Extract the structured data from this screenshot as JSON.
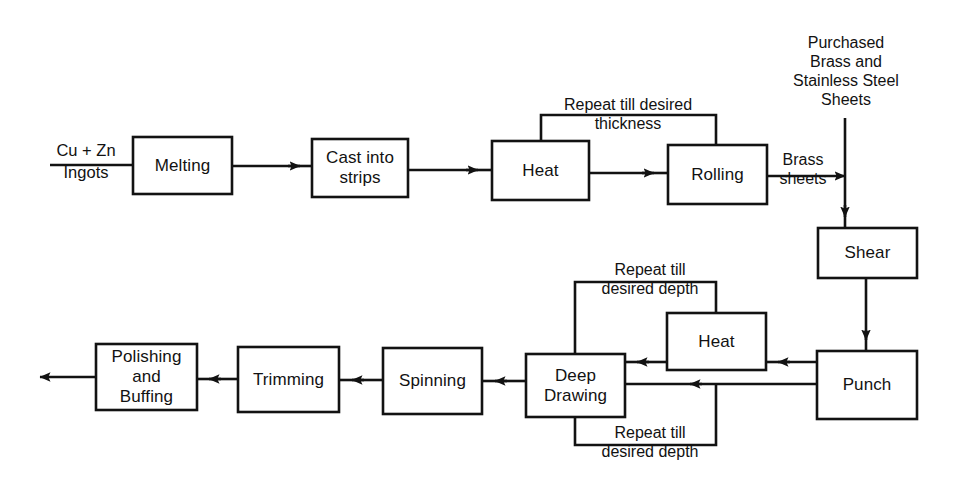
{
  "diagram": {
    "stroke_color": "#121212",
    "background_color": "#ffffff",
    "nodes": [
      {
        "id": "melting",
        "label": "Melting"
      },
      {
        "id": "cast",
        "label": "Cast into\nstrips"
      },
      {
        "id": "heat1",
        "label": "Heat"
      },
      {
        "id": "rolling",
        "label": "Rolling"
      },
      {
        "id": "shear",
        "label": "Shear"
      },
      {
        "id": "punch",
        "label": "Punch"
      },
      {
        "id": "heat2",
        "label": "Heat"
      },
      {
        "id": "deep",
        "label": "Deep\nDrawing"
      },
      {
        "id": "spinning",
        "label": "Spinning"
      },
      {
        "id": "trimming",
        "label": "Trimming"
      },
      {
        "id": "polishing",
        "label": "Polishing\nand\nBuffing"
      }
    ],
    "edge_labels": {
      "input_numerator": "Cu + Zn",
      "input_denominator": "Ingots",
      "repeat_thickness": "Repeat till desired\nthickness",
      "brass_sheets": "Brass\nsheets",
      "purchased_sheets": "Purchased\nBrass and\nStainless Steel\nSheets",
      "repeat_depth_top": "Repeat till\ndesired depth",
      "repeat_depth_bottom": "Repeat till\ndesired depth"
    }
  }
}
